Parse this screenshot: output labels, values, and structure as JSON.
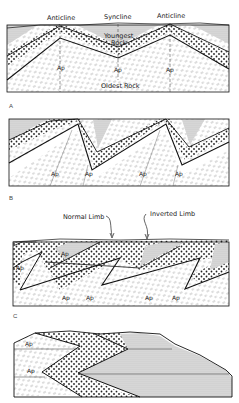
{
  "figure": {
    "colors": {
      "ink": "#222222",
      "youngest_fill": "#cfcfcf",
      "dotted_layer_fill": "#ffffff",
      "oldest_fill": "#ffffff"
    },
    "legend_rock_units": [
      {
        "unit": "youngest",
        "pattern": "fine-stipple"
      },
      {
        "unit": "middle",
        "pattern": "coarse-dots"
      },
      {
        "unit": "oldest",
        "pattern": "dashes"
      }
    ]
  },
  "panels": [
    {
      "id": "A",
      "label": "A",
      "annotations": {
        "anticline_left": "Anticline",
        "syncline": "Syncline",
        "anticline_right": "Anticline",
        "youngest_1": "Youngest",
        "youngest_2": "Rock",
        "oldest": "Oldest Rock"
      },
      "axial_plane_labels": [
        "Ap",
        "Ap",
        "Ap"
      ]
    },
    {
      "id": "B",
      "label": "B",
      "axial_plane_labels": [
        "Ap",
        "Ap",
        "Ap",
        "Ap"
      ]
    },
    {
      "id": "C",
      "label": "C",
      "annotations": {
        "normal_limb": "Normal Limb",
        "inverted_limb": "Inverted Limb"
      },
      "axial_plane_labels": [
        "Ap",
        "Ap",
        "Ap",
        "Ap",
        "Ap",
        "Ap"
      ]
    },
    {
      "id": "D",
      "label": "",
      "axial_plane_labels": [
        "Ap",
        "Ap"
      ]
    }
  ]
}
